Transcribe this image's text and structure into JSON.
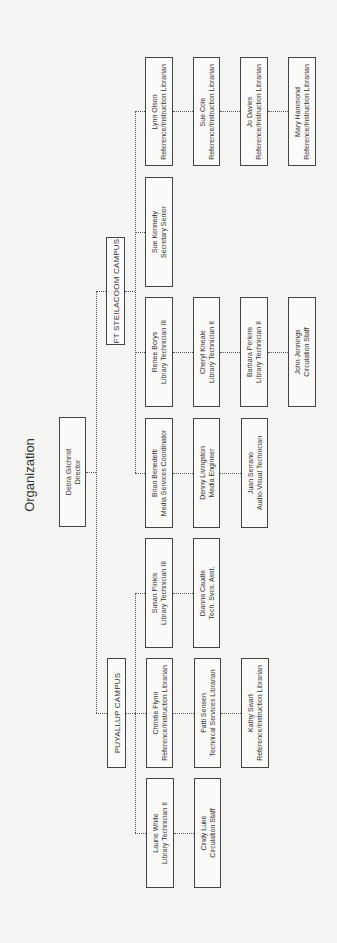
{
  "title": "Organization",
  "director": {
    "name": "Debra Gilchrist",
    "role": "Director"
  },
  "campuses": [
    {
      "name": "FT STEILACOOM CAMPUS",
      "columns": [
        [
          {
            "name": "Lynn Olson",
            "role": "Reference/Instruction Librarian"
          },
          {
            "name": "Sue Cole",
            "role": "Reference/Instruction Librarian"
          },
          {
            "name": "Jo Davies",
            "role": "Reference/Instruction Librarian"
          },
          {
            "name": "Mary Hammond",
            "role": "Reference/Instruction Librarian"
          }
        ],
        [
          {
            "name": "Sue Kennedy",
            "role": "Secretary Senior"
          }
        ],
        [
          {
            "name": "Renee Borys",
            "role": "Library Technician III"
          },
          {
            "name": "Cheryl Kneale",
            "role": "Library Technician II"
          },
          {
            "name": "Barbara Perkins",
            "role": "Library Technician II"
          },
          {
            "name": "John Jennings",
            "role": "Circulation Staff"
          }
        ],
        [
          {
            "name": "Brian Benedetti",
            "role": "Media Services Coordinator"
          },
          {
            "name": "Denny Livingston",
            "role": "Media Engineer"
          },
          {
            "name": "Juan Serrano",
            "role": "Audio-Visual Technician"
          }
        ]
      ]
    },
    {
      "name": "PUYALLUP CAMPUS",
      "columns": [
        [
          {
            "name": "Susan Pinkis",
            "role": "Library Technician III"
          },
          {
            "name": "Dianna Caudle",
            "role": "Tech. Svcs. Asst."
          }
        ],
        [
          {
            "name": "Christie Flynn",
            "role": "Reference/Instruction Librarian"
          },
          {
            "name": "Patti Sensen",
            "role": "Technical Services Librarian"
          },
          {
            "name": "Kathy Swart",
            "role": "Reference/Instruction Librarian"
          }
        ],
        [
          {
            "name": "Laurie White",
            "role": "Library Technician II"
          },
          {
            "name": "Cindy Luke",
            "role": "Circulation Staff"
          }
        ]
      ]
    }
  ]
}
